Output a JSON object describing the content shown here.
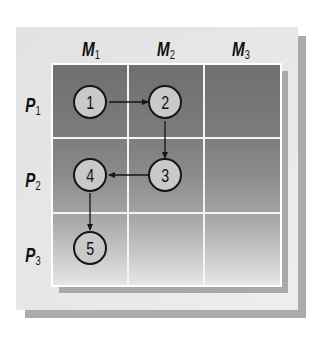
{
  "diagram": {
    "title": "",
    "columns": [
      {
        "label": "M",
        "sub": "1"
      },
      {
        "label": "M",
        "sub": "2"
      },
      {
        "label": "M",
        "sub": "3"
      }
    ],
    "rows": [
      {
        "label": "P",
        "sub": "1"
      },
      {
        "label": "P",
        "sub": "2"
      },
      {
        "label": "P",
        "sub": "3"
      }
    ],
    "nodes": [
      {
        "id": "1",
        "label": "1",
        "row": 1,
        "col": 1
      },
      {
        "id": "2",
        "label": "2",
        "row": 1,
        "col": 2
      },
      {
        "id": "3",
        "label": "3",
        "row": 2,
        "col": 2
      },
      {
        "id": "4",
        "label": "4",
        "row": 2,
        "col": 1
      },
      {
        "id": "5",
        "label": "5",
        "row": 3,
        "col": 1
      }
    ],
    "edges": [
      {
        "from": "1",
        "to": "2",
        "direction": "right"
      },
      {
        "from": "2",
        "to": "3",
        "direction": "down"
      },
      {
        "from": "3",
        "to": "4",
        "direction": "left"
      },
      {
        "from": "4",
        "to": "5",
        "direction": "down"
      }
    ],
    "colors": {
      "panel": "#e6e6e6",
      "panel_shadow": "#ababab",
      "grid_top": "#6f6f6f",
      "grid_bottom": "#e6e6e6",
      "grid_lines": "#f4f4f4",
      "node_fill": "#c9c9c9",
      "node_stroke": "#151515",
      "text": "#111111"
    }
  }
}
